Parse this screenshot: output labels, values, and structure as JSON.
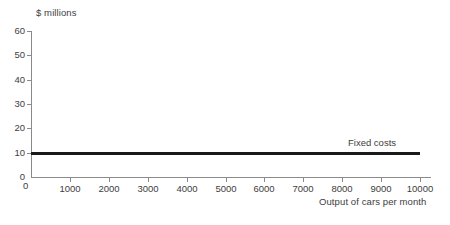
{
  "chart_data": {
    "type": "line",
    "title": "",
    "xlabel": "Output of cars per month",
    "ylabel": "$ millions",
    "xlim": [
      0,
      10000
    ],
    "ylim": [
      0,
      60
    ],
    "grid": false,
    "legend_position": "inline-annotation",
    "x_ticks": [
      "0",
      "1000",
      "2000",
      "3000",
      "4000",
      "5000",
      "6000",
      "7000",
      "8000",
      "9000",
      "10000"
    ],
    "x_tick_values": [
      0,
      1000,
      2000,
      3000,
      4000,
      5000,
      6000,
      7000,
      8000,
      9000,
      10000
    ],
    "y_ticks": [
      "0",
      "10",
      "20",
      "30",
      "40",
      "50",
      "60"
    ],
    "y_tick_values": [
      0,
      10,
      20,
      30,
      40,
      50,
      60
    ],
    "series": [
      {
        "name": "Fixed costs",
        "annotation": "Fixed costs",
        "color": "#1a1a1a",
        "x": [
          0,
          10000
        ],
        "values": [
          10,
          10
        ],
        "constant_value": 10
      }
    ]
  },
  "axes": {
    "y_title": "$ millions",
    "x_title": "Output of cars per month"
  },
  "annotations": {
    "fixed_costs": "Fixed costs"
  },
  "colors": {
    "line": "#1a1a1a",
    "axis": "#8a8a8a",
    "text": "#3d3d3d",
    "background": "#ffffff"
  }
}
